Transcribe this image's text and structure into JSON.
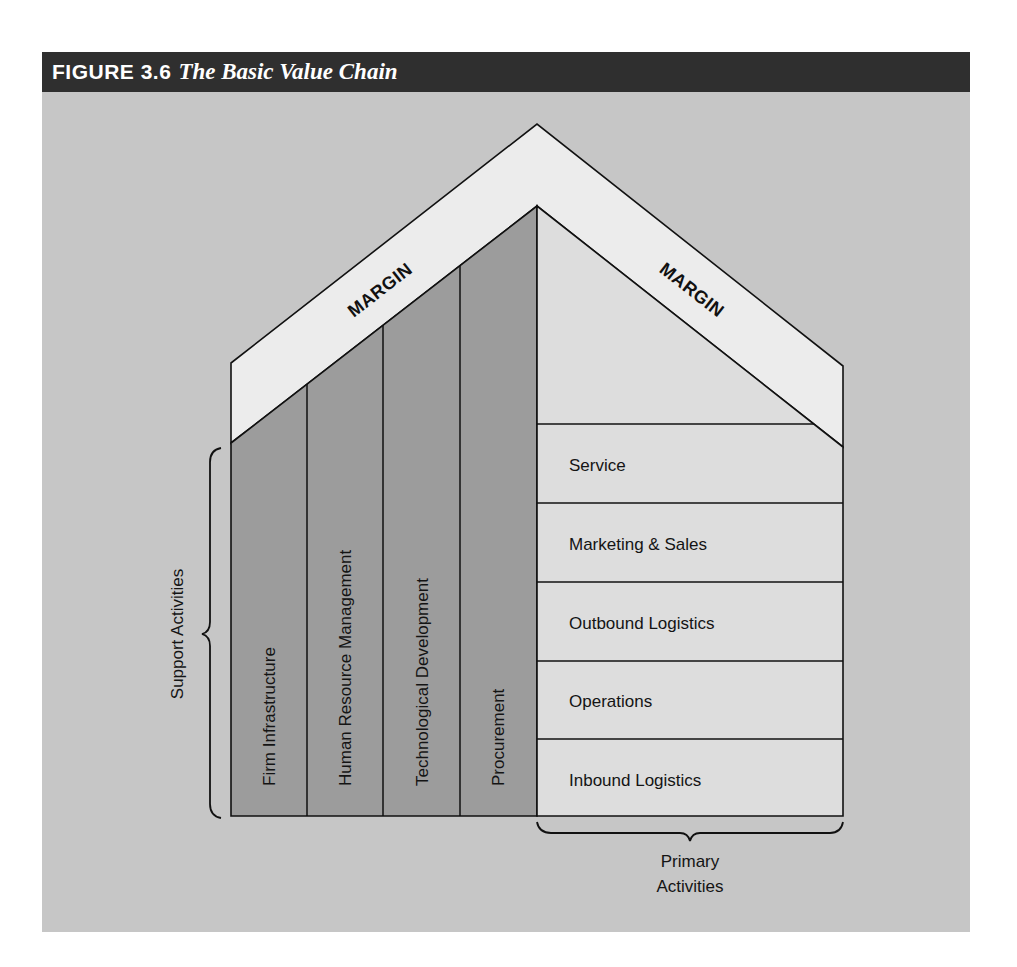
{
  "figure": {
    "label": "FIGURE 3.6",
    "title": "The Basic Value Chain"
  },
  "margin": {
    "left_label": "MARGIN",
    "right_label": "MARGIN"
  },
  "support_activities": {
    "group_label": "Support Activities",
    "items": [
      {
        "label": "Firm Infrastructure"
      },
      {
        "label": "Human Resource Management"
      },
      {
        "label": "Technological Development"
      },
      {
        "label": "Procurement"
      }
    ]
  },
  "primary_activities": {
    "group_label_line1": "Primary",
    "group_label_line2": "Activities",
    "items": [
      {
        "label": "Service"
      },
      {
        "label": "Marketing & Sales"
      },
      {
        "label": "Outbound Logistics"
      },
      {
        "label": "Operations"
      },
      {
        "label": "Inbound Logistics"
      }
    ]
  },
  "colors": {
    "header": "#2f2f2f",
    "background": "#c6c6c6",
    "margin_band": "#ececec",
    "support": "#9c9c9c",
    "primary": "#dddddd"
  }
}
